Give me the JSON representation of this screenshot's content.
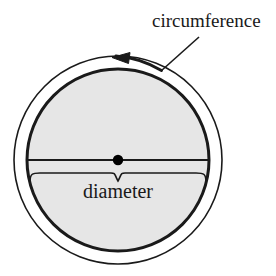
{
  "figure": {
    "background_color": "#ffffff",
    "labels": {
      "circumference": "circumference",
      "diameter": "diameter"
    },
    "colors": {
      "stroke": "#1a1a1a",
      "disc_fill": "#e6e6e6",
      "ring_fill": "#ffffff",
      "center_dot": "#000000",
      "text": "#1a1a1a"
    },
    "geometry": {
      "center_x": 118,
      "center_y": 160,
      "outer_circle_radius": 104,
      "inner_circle_radius": 91,
      "inner_circle_stroke_width": 3,
      "outer_circle_stroke_width": 1.6,
      "diameter_line_y": 160,
      "center_dot_radius": 5,
      "brace_y": 174,
      "brace_left_x": 29,
      "brace_right_x": 207,
      "arrow_tip_x": 116,
      "arrow_tip_y": 57,
      "leader_line_start_x": 199,
      "leader_line_start_y": 37,
      "leader_line_end_x": 161,
      "leader_line_end_y": 71
    },
    "label_positions": {
      "circumference_x": 152,
      "circumference_y": 27,
      "diameter_x": 118,
      "diameter_y": 196
    },
    "annotations": {
      "arrow_direction": "counterclockwise",
      "arrow_on": "outer-circumference-arc"
    }
  }
}
